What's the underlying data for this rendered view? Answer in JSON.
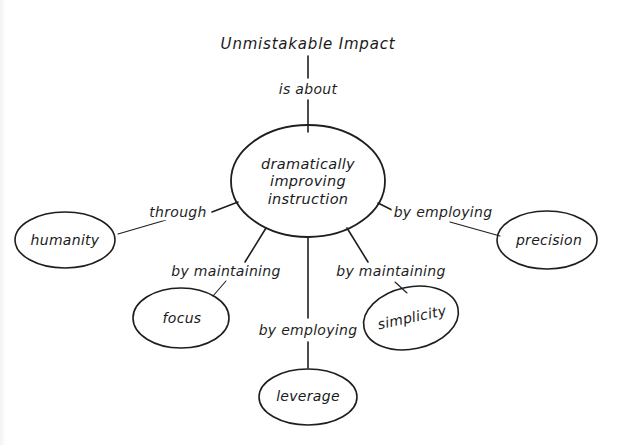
{
  "diagram": {
    "type": "concept-map",
    "root": {
      "id": "root",
      "label": "Unmistakable Impact"
    },
    "center": {
      "id": "center",
      "lines": [
        "dramatically",
        "improving",
        "instruction"
      ]
    },
    "links": {
      "root_to_center": "is about",
      "humanity": "through",
      "precision": "by employing",
      "focus": "by maintaining",
      "simplicity": "by maintaining",
      "leverage": "by employing"
    },
    "nodes": {
      "humanity": "humanity",
      "precision": "precision",
      "focus": "focus",
      "simplicity": "simplicity",
      "leverage": "leverage"
    },
    "colors": {
      "ink": "#1e1e1e",
      "background": "#ffffff"
    }
  }
}
